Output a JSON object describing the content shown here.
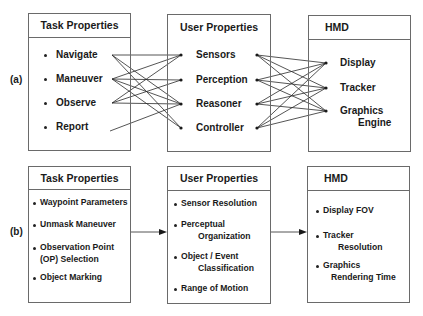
{
  "panels": {
    "a": {
      "label": "(a)",
      "task": {
        "title": "Task Properties",
        "items": [
          "Navigate",
          "Maneuver",
          "Observe",
          "Report"
        ]
      },
      "user": {
        "title": "User Properties",
        "items": [
          "Sensors",
          "Perception",
          "Reasoner",
          "Controller"
        ]
      },
      "hmd": {
        "title": "HMD",
        "items": [
          "Display",
          "Tracker",
          "Graphics",
          "Engine"
        ]
      },
      "task_to_user_links": [
        [
          "Navigate",
          "Sensors"
        ],
        [
          "Navigate",
          "Reasoner"
        ],
        [
          "Navigate",
          "Controller"
        ],
        [
          "Maneuver",
          "Sensors"
        ],
        [
          "Maneuver",
          "Perception"
        ],
        [
          "Maneuver",
          "Reasoner"
        ],
        [
          "Maneuver",
          "Controller"
        ],
        [
          "Observe",
          "Sensors"
        ],
        [
          "Observe",
          "Perception"
        ],
        [
          "Observe",
          "Reasoner"
        ],
        [
          "Report",
          "Reasoner"
        ]
      ],
      "user_to_hmd_links": "all-to-all"
    },
    "b": {
      "label": "(b)",
      "task": {
        "title": "Task Properties",
        "items": [
          "Waypoint Parameters",
          "Unmask Maneuver",
          "Observation Point",
          "(OP) Selection",
          "Object Marking"
        ]
      },
      "user": {
        "title": "User Properties",
        "items": [
          "Sensor Resolution",
          "Perceptual",
          "Organization",
          "Object / Event",
          "Classification",
          "Range of Motion"
        ]
      },
      "hmd": {
        "title": "HMD",
        "items": [
          "Display FOV",
          "Tracker",
          "Resolution",
          "Graphics",
          "Rendering Time"
        ]
      }
    }
  },
  "colors": {
    "line": "#2a2a2a",
    "border": "#6a6a6a",
    "text": "#1a1a1a"
  }
}
